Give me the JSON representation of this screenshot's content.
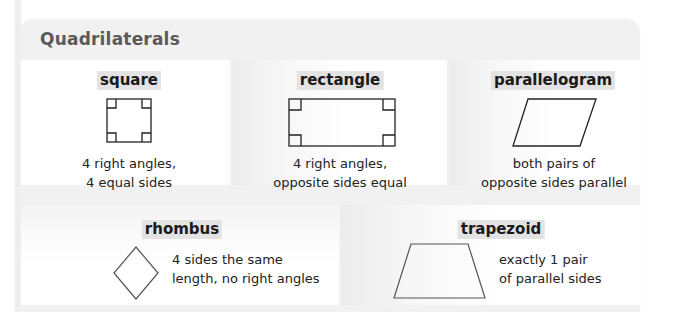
{
  "section": {
    "title": "Quadrilaterals"
  },
  "shapes": [
    {
      "name": "square",
      "description_lines": [
        "4 right angles,",
        "4 equal sides"
      ],
      "icon": "square-with-right-angle-marks"
    },
    {
      "name": "rectangle",
      "description_lines": [
        "4 right angles,",
        "opposite sides equal"
      ],
      "icon": "rectangle-with-right-angle-marks"
    },
    {
      "name": "parallelogram",
      "description_lines": [
        "both pairs of",
        "opposite sides parallel"
      ],
      "icon": "parallelogram-shape"
    },
    {
      "name": "rhombus",
      "description_lines": [
        "4 sides the same",
        "length, no right angles"
      ],
      "icon": "rhombus-shape"
    },
    {
      "name": "trapezoid",
      "description_lines": [
        "exactly 1 pair",
        "of parallel sides"
      ],
      "icon": "trapezoid-shape"
    }
  ],
  "colors": {
    "title_text": "#5a5a5a",
    "term_highlight": "#e3e3e3",
    "frame_background": "#f1f1f1",
    "cell_background": "#ffffff",
    "shape_stroke": "#222222"
  }
}
